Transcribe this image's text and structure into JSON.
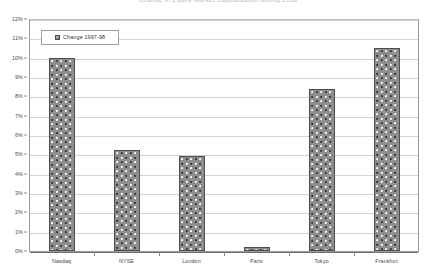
{
  "chart_data": {
    "type": "bar",
    "title": "Change in Equity Market Capitalisation during 1998",
    "subtitle": "",
    "xlabel": "",
    "ylabel": "",
    "categories": [
      "Nasdaq",
      "NYSE",
      "London",
      "Paris",
      "Tokyo",
      "Frankfurt"
    ],
    "series": [
      {
        "name": "Change 1997-98",
        "values": [
          10.0,
          5.2,
          4.9,
          0.2,
          8.4,
          10.5
        ]
      }
    ],
    "values": [
      10.0,
      5.2,
      4.9,
      0.2,
      8.4,
      10.5
    ],
    "ylim": [
      0,
      12
    ],
    "ytick_step": 1,
    "ytick_labels": [
      "0%",
      "1%",
      "2%",
      "3%",
      "4%",
      "5%",
      "6%",
      "7%",
      "8%",
      "9%",
      "10%",
      "11%",
      "12%"
    ],
    "ytick_values": [
      0,
      1,
      2,
      3,
      4,
      5,
      6,
      7,
      8,
      9,
      10,
      11,
      12
    ],
    "grid": true,
    "grid_axis": "y",
    "legend": {
      "position": "top-left-inside",
      "entries": [
        "Change 1997-98"
      ]
    },
    "bar_fill": "#8e8e8e",
    "bar_pattern": "checkered-dots",
    "bar_border": "#4e4e4e",
    "plot_border": "#9a9a9a",
    "gridline_color": "#d2d2d2",
    "background": "#ffffff"
  },
  "legend": {
    "label": "Change 1997-98",
    "swatch_name": "pattern-swatch"
  },
  "title": {
    "text": "Change in Equity Market Capitalisation during 1998"
  }
}
